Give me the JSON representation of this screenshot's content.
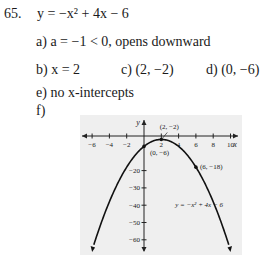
{
  "problem": {
    "number": "65.",
    "equation": "y = −x² + 4x − 6",
    "parts": {
      "a": {
        "label": "a)",
        "text": "a = −1 < 0, opens downward"
      },
      "b": {
        "label": "b)",
        "text": "x = 2"
      },
      "c": {
        "label": "c)",
        "text": "(2, −2)"
      },
      "d": {
        "label": "d)",
        "text": "(0, −6)"
      },
      "e": {
        "label": "e)",
        "text": "no x-intercepts"
      },
      "f": {
        "label": "f)"
      }
    }
  },
  "chart_data": {
    "type": "line",
    "title": "",
    "xlabel": "x",
    "ylabel": "y",
    "x_ticks": [
      -6,
      -4,
      -2,
      2,
      4,
      6,
      8,
      10
    ],
    "y_ticks": [
      -20,
      -30,
      -40,
      -50,
      -60
    ],
    "xlim": [
      -7,
      11
    ],
    "ylim": [
      -65,
      8
    ],
    "series": [
      {
        "name": "y = −x² + 4x − 6",
        "function": "-x^2+4x-6",
        "x": [
          -4,
          -2,
          0,
          2,
          4,
          6,
          8
        ],
        "values": [
          -30,
          -18,
          -6,
          -2,
          -6,
          -18,
          -38
        ]
      }
    ],
    "annotations": [
      {
        "point": [
          2,
          -2
        ],
        "label": "(2, −2)"
      },
      {
        "point": [
          0,
          -6
        ],
        "label": "(0, −6)"
      },
      {
        "point": [
          6,
          -18
        ],
        "label": "(6, −18)"
      }
    ],
    "curve_label": "y = −x² + 4x − 6",
    "grid": false
  }
}
